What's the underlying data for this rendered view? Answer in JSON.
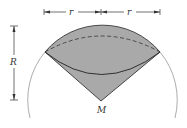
{
  "diagram": {
    "labels": {
      "r_left": "r",
      "r_right": "r",
      "R": "R",
      "M": "M"
    },
    "colors": {
      "fill": "#a9a9a9",
      "stroke": "#222222",
      "sphere": "#888888"
    }
  }
}
